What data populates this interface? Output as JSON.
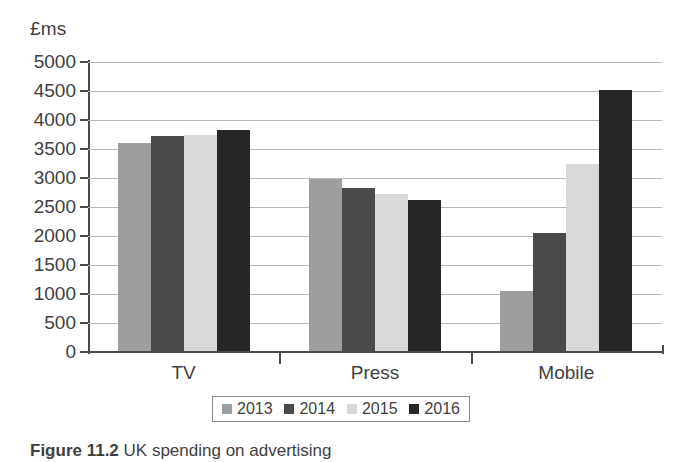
{
  "chart_data": {
    "type": "bar",
    "title": "",
    "xlabel": "",
    "ylabel": "£ms",
    "ylim": [
      0,
      5000
    ],
    "ytick_values": [
      0,
      500,
      1000,
      1500,
      2000,
      2500,
      3000,
      3500,
      4000,
      4500,
      5000
    ],
    "ytick_labels": [
      "0",
      "500",
      "1000",
      "1500",
      "2000",
      "2500",
      "3000",
      "3500",
      "4000",
      "4500",
      "5000"
    ],
    "grid": true,
    "legend_position": "bottom",
    "categories": [
      "TV",
      "Press",
      "Mobile"
    ],
    "series": [
      {
        "name": "2013",
        "color": "#9e9e9e",
        "values": [
          3600,
          2990,
          1050
        ]
      },
      {
        "name": "2014",
        "color": "#4a4a4a",
        "values": [
          3720,
          2820,
          2050
        ]
      },
      {
        "name": "2015",
        "color": "#d9d9d9",
        "values": [
          3750,
          2720,
          3250
        ]
      },
      {
        "name": "2016",
        "color": "#262626",
        "values": [
          3820,
          2620,
          4520
        ]
      }
    ]
  },
  "axis": {
    "unit_label": "£ms"
  },
  "legend": {
    "items": [
      {
        "label": "2013",
        "color": "#9e9e9e"
      },
      {
        "label": "2014",
        "color": "#4a4a4a"
      },
      {
        "label": "2015",
        "color": "#d9d9d9"
      },
      {
        "label": "2016",
        "color": "#262626"
      }
    ]
  },
  "caption": {
    "number": "Figure 11.2",
    "text": "UK spending on advertising"
  }
}
